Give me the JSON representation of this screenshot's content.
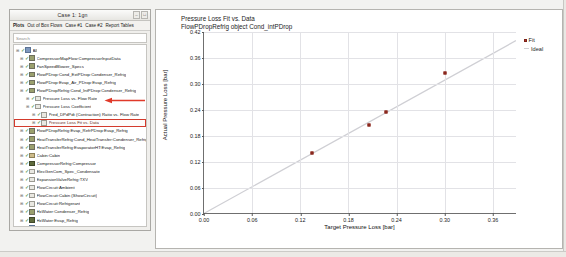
{
  "window": {
    "title": "Case 1: 1gn",
    "buttons": [
      "–",
      "□"
    ],
    "menu": [
      "Plots",
      "Out of Box Flows",
      "Case #1",
      "Case #2",
      "Report Tables"
    ],
    "search_placeholder": "Search"
  },
  "tree": {
    "items": [
      {
        "label": "All",
        "indent": 0,
        "icon": "globe",
        "checked": true
      },
      {
        "label": "CompressorMapFlow:CompressorInputData",
        "indent": 1,
        "icon": "green",
        "checked": true
      },
      {
        "label": "FanSpeedBlower_Specs",
        "indent": 1,
        "icon": "green",
        "checked": true
      },
      {
        "label": "FlowPDrop:Cond_ExtPDrop:Condenser_Refrig",
        "indent": 1,
        "icon": "green",
        "checked": true
      },
      {
        "label": "FlowPDrop:Evap_Air_PDrop:Evap_Refrig",
        "indent": 1,
        "icon": "green",
        "checked": true
      },
      {
        "label": "FlowPDropRefrig:Cond_IntPDrop:Condenser_Refrig",
        "indent": 1,
        "icon": "green",
        "checked": true
      },
      {
        "label": "Pressure Loss vs. Flow Rate",
        "indent": 2,
        "icon": "doc",
        "checked": true
      },
      {
        "label": "Pressure Loss Coefficient",
        "indent": 2,
        "icon": "doc",
        "checked": true
      },
      {
        "label": "Pred_DPdPdt (Contraction) Ratio vs. Flow Rate",
        "indent": 3,
        "icon": "doc",
        "checked": true
      },
      {
        "label": "Pressure Loss Fit vs. Data",
        "indent": 3,
        "icon": "doc",
        "checked": true,
        "selected": true
      },
      {
        "label": "FlowPDropRefrig:Evap_RefrPDrop:Evap_Refrig",
        "indent": 1,
        "icon": "green",
        "checked": true
      },
      {
        "label": "HeatTransferRefrig:Cond_HeatTransfer:Condenser_Refrig",
        "indent": 1,
        "icon": "green",
        "checked": true
      },
      {
        "label": "HeatTransferRefrig:EvaporatorHT:Evap_Refrig",
        "indent": 1,
        "icon": "green",
        "checked": true
      },
      {
        "label": "Cabin:Cabin",
        "indent": 1,
        "icon": "tan",
        "checked": true
      },
      {
        "label": "CompressorRefrig:Compressor",
        "indent": 1,
        "icon": "dark",
        "checked": true
      },
      {
        "label": "ElecGenCom_Spec_Condensate",
        "indent": 1,
        "icon": "doc",
        "checked": true
      },
      {
        "label": "ExpansionValveRefrig:TXV",
        "indent": 1,
        "icon": "doc",
        "checked": true
      },
      {
        "label": "FlowCircuit:Ambient",
        "indent": 1,
        "icon": "doc",
        "checked": true
      },
      {
        "label": "FlowCircuit:Cabin (ShowCircuit)",
        "indent": 1,
        "icon": "doc",
        "checked": true
      },
      {
        "label": "FlowCircuit:Refrigerant",
        "indent": 1,
        "icon": "doc",
        "checked": true
      },
      {
        "label": "HxWater:Condenser_Refrig",
        "indent": 1,
        "icon": "green",
        "checked": true
      },
      {
        "label": "HxWater:Evap_Refrig",
        "indent": 1,
        "icon": "dark",
        "checked": true
      },
      {
        "label": "PntIntegratorRefrig:PntIntegratorRefrig",
        "indent": 1,
        "icon": "blue",
        "checked": true
      },
      {
        "label": "PipeBound:Compressor_Inlet",
        "indent": 1,
        "icon": "green",
        "checked": true
      },
      {
        "label": "PipeBound:Condenser_Inlet",
        "indent": 1,
        "icon": "green",
        "checked": true
      },
      {
        "label": "PipeBound:TXV_Inlet",
        "indent": 1,
        "icon": "green",
        "checked": true
      },
      {
        "label": "SolveBoundaryRefComp_Attri",
        "indent": 1,
        "icon": "doc",
        "checked": true
      }
    ],
    "check_glyph": "✓",
    "expander_glyph": "⊞"
  },
  "chart_data": {
    "type": "scatter",
    "title": "Pressure Loss Fit vs. Data",
    "subtitle": "FlowPDropRefrig object Cond_intPDrop",
    "xlabel": "Target Pressure Loss [bar]",
    "ylabel": "Actual Pressure Loss [bar]",
    "xlim": [
      0.0,
      0.39
    ],
    "ylim": [
      0.0,
      0.42
    ],
    "xticks": [
      "0.00",
      "0.06",
      "0.12",
      "0.18",
      "0.24",
      "0.30",
      "0.36"
    ],
    "xtick_values": [
      0.0,
      0.06,
      0.12,
      0.18,
      0.24,
      0.3,
      0.36
    ],
    "yticks": [
      "0.00",
      "0.06",
      "0.12",
      "0.18",
      "0.24",
      "0.30",
      "0.36",
      "0.42"
    ],
    "ytick_values": [
      0.0,
      0.06,
      0.12,
      0.18,
      0.24,
      0.3,
      0.36,
      0.42
    ],
    "grid": true,
    "legend_position": "right",
    "series": [
      {
        "name": "Fit",
        "type": "scatter",
        "color": "#b03a2e",
        "points": [
          {
            "x": 0.135,
            "y": 0.141
          },
          {
            "x": 0.205,
            "y": 0.205
          },
          {
            "x": 0.227,
            "y": 0.235
          },
          {
            "x": 0.3,
            "y": 0.326
          }
        ]
      },
      {
        "name": "Ideal",
        "type": "line",
        "color": "#cfcfd4",
        "points": [
          {
            "x": 0.0,
            "y": 0.0
          },
          {
            "x": 0.39,
            "y": 0.4
          }
        ]
      }
    ]
  },
  "annotation": {
    "arrow_color": "#e03a2a",
    "points_to": "Pressure Loss Fit vs. Data"
  }
}
